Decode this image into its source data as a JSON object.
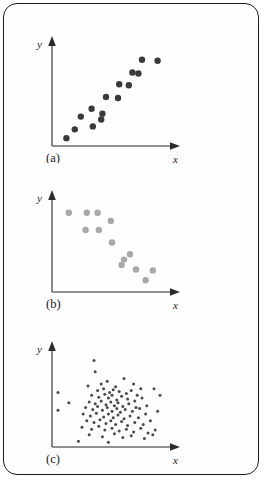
{
  "figure": {
    "frame_color": "#1a1a1a",
    "background_color": "#fefefe"
  },
  "chart_data": [
    {
      "type": "scatter",
      "panel": "(a)",
      "title": "",
      "xlabel": "x",
      "ylabel": "y",
      "xlim": [
        0,
        100
      ],
      "ylim": [
        0,
        100
      ],
      "grid": false,
      "legend": "none",
      "marker_color": "#3a3a3a",
      "marker_size": 3.2,
      "relationship": "positive linear correlation",
      "n_points": 15,
      "points": [
        {
          "x": 12,
          "y": 8
        },
        {
          "x": 19,
          "y": 17
        },
        {
          "x": 24,
          "y": 30
        },
        {
          "x": 33,
          "y": 38
        },
        {
          "x": 34,
          "y": 20
        },
        {
          "x": 42,
          "y": 33
        },
        {
          "x": 41,
          "y": 27
        },
        {
          "x": 45,
          "y": 50
        },
        {
          "x": 55,
          "y": 49
        },
        {
          "x": 56,
          "y": 63
        },
        {
          "x": 64,
          "y": 62
        },
        {
          "x": 67,
          "y": 75
        },
        {
          "x": 72,
          "y": 74
        },
        {
          "x": 75,
          "y": 88
        },
        {
          "x": 88,
          "y": 87
        }
      ]
    },
    {
      "type": "scatter",
      "panel": "(b)",
      "title": "",
      "xlabel": "x",
      "ylabel": "y",
      "xlim": [
        0,
        100
      ],
      "ylim": [
        0,
        100
      ],
      "grid": false,
      "legend": "none",
      "marker_color": "#a8a8a8",
      "marker_size": 3.2,
      "relationship": "negative linear correlation",
      "n_points": 13,
      "points": [
        {
          "x": 14,
          "y": 88
        },
        {
          "x": 29,
          "y": 88
        },
        {
          "x": 38,
          "y": 88
        },
        {
          "x": 49,
          "y": 79
        },
        {
          "x": 28,
          "y": 69
        },
        {
          "x": 39,
          "y": 69
        },
        {
          "x": 50,
          "y": 55
        },
        {
          "x": 65,
          "y": 42
        },
        {
          "x": 60,
          "y": 36
        },
        {
          "x": 58,
          "y": 30
        },
        {
          "x": 70,
          "y": 25
        },
        {
          "x": 84,
          "y": 24
        },
        {
          "x": 78,
          "y": 13
        }
      ]
    },
    {
      "type": "scatter",
      "panel": "(c)",
      "title": "",
      "xlabel": "x",
      "ylabel": "y",
      "xlim": [
        0,
        100
      ],
      "ylim": [
        0,
        100
      ],
      "grid": false,
      "legend": "none",
      "marker_color": "#4a4a4a",
      "marker_size": 1.5,
      "relationship": "no correlation (random cloud)",
      "n_points": 96,
      "points": [
        {
          "x": 35,
          "y": 92
        },
        {
          "x": 36,
          "y": 80
        },
        {
          "x": 5,
          "y": 58
        },
        {
          "x": 14,
          "y": 47
        },
        {
          "x": 5,
          "y": 39
        },
        {
          "x": 30,
          "y": 65
        },
        {
          "x": 41,
          "y": 67
        },
        {
          "x": 46,
          "y": 70
        },
        {
          "x": 53,
          "y": 64
        },
        {
          "x": 60,
          "y": 73
        },
        {
          "x": 68,
          "y": 67
        },
        {
          "x": 74,
          "y": 62
        },
        {
          "x": 38,
          "y": 60
        },
        {
          "x": 43,
          "y": 62
        },
        {
          "x": 48,
          "y": 58
        },
        {
          "x": 51,
          "y": 61
        },
        {
          "x": 56,
          "y": 59
        },
        {
          "x": 62,
          "y": 57
        },
        {
          "x": 66,
          "y": 60
        },
        {
          "x": 71,
          "y": 55
        },
        {
          "x": 33,
          "y": 55
        },
        {
          "x": 39,
          "y": 53
        },
        {
          "x": 44,
          "y": 56
        },
        {
          "x": 47,
          "y": 52
        },
        {
          "x": 50,
          "y": 55
        },
        {
          "x": 54,
          "y": 50
        },
        {
          "x": 58,
          "y": 54
        },
        {
          "x": 63,
          "y": 51
        },
        {
          "x": 69,
          "y": 49
        },
        {
          "x": 75,
          "y": 52
        },
        {
          "x": 31,
          "y": 48
        },
        {
          "x": 36,
          "y": 46
        },
        {
          "x": 41,
          "y": 49
        },
        {
          "x": 45,
          "y": 45
        },
        {
          "x": 49,
          "y": 48
        },
        {
          "x": 52,
          "y": 44
        },
        {
          "x": 55,
          "y": 47
        },
        {
          "x": 59,
          "y": 43
        },
        {
          "x": 64,
          "y": 46
        },
        {
          "x": 70,
          "y": 42
        },
        {
          "x": 28,
          "y": 42
        },
        {
          "x": 34,
          "y": 40
        },
        {
          "x": 38,
          "y": 43
        },
        {
          "x": 42,
          "y": 39
        },
        {
          "x": 46,
          "y": 42
        },
        {
          "x": 50,
          "y": 38
        },
        {
          "x": 54,
          "y": 41
        },
        {
          "x": 57,
          "y": 37
        },
        {
          "x": 61,
          "y": 40
        },
        {
          "x": 67,
          "y": 38
        },
        {
          "x": 73,
          "y": 41
        },
        {
          "x": 79,
          "y": 44
        },
        {
          "x": 26,
          "y": 35
        },
        {
          "x": 32,
          "y": 33
        },
        {
          "x": 37,
          "y": 36
        },
        {
          "x": 43,
          "y": 32
        },
        {
          "x": 47,
          "y": 35
        },
        {
          "x": 51,
          "y": 31
        },
        {
          "x": 55,
          "y": 34
        },
        {
          "x": 60,
          "y": 30
        },
        {
          "x": 65,
          "y": 33
        },
        {
          "x": 72,
          "y": 31
        },
        {
          "x": 78,
          "y": 35
        },
        {
          "x": 29,
          "y": 28
        },
        {
          "x": 35,
          "y": 26
        },
        {
          "x": 40,
          "y": 29
        },
        {
          "x": 45,
          "y": 25
        },
        {
          "x": 49,
          "y": 28
        },
        {
          "x": 53,
          "y": 24
        },
        {
          "x": 58,
          "y": 27
        },
        {
          "x": 63,
          "y": 23
        },
        {
          "x": 69,
          "y": 26
        },
        {
          "x": 76,
          "y": 24
        },
        {
          "x": 82,
          "y": 28
        },
        {
          "x": 25,
          "y": 21
        },
        {
          "x": 33,
          "y": 19
        },
        {
          "x": 39,
          "y": 22
        },
        {
          "x": 44,
          "y": 18
        },
        {
          "x": 50,
          "y": 20
        },
        {
          "x": 56,
          "y": 17
        },
        {
          "x": 62,
          "y": 19
        },
        {
          "x": 68,
          "y": 16
        },
        {
          "x": 74,
          "y": 20
        },
        {
          "x": 80,
          "y": 15
        },
        {
          "x": 86,
          "y": 18
        },
        {
          "x": 31,
          "y": 13
        },
        {
          "x": 42,
          "y": 11
        },
        {
          "x": 52,
          "y": 14
        },
        {
          "x": 59,
          "y": 10
        },
        {
          "x": 66,
          "y": 12
        },
        {
          "x": 77,
          "y": 9
        },
        {
          "x": 84,
          "y": 13
        },
        {
          "x": 88,
          "y": 38
        },
        {
          "x": 90,
          "y": 55
        },
        {
          "x": 85,
          "y": 62
        },
        {
          "x": 22,
          "y": 6
        },
        {
          "x": 47,
          "y": 5
        }
      ]
    }
  ]
}
